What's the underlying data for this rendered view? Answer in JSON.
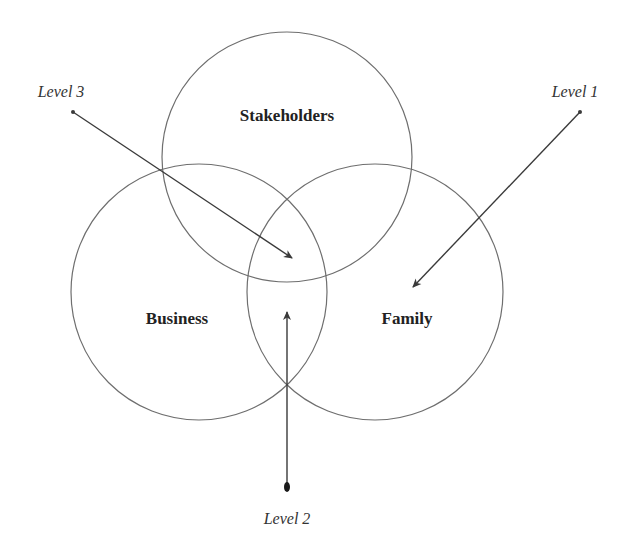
{
  "diagram": {
    "type": "venn",
    "sets": [
      {
        "id": "stakeholders",
        "label": "Stakeholders",
        "cx": 287,
        "cy": 157,
        "r": 125,
        "label_x": 287,
        "label_y": 121
      },
      {
        "id": "business",
        "label": "Business",
        "cx": 199,
        "cy": 292,
        "r": 128,
        "label_x": 177,
        "label_y": 324
      },
      {
        "id": "family",
        "label": "Family",
        "cx": 375,
        "cy": 292,
        "r": 128,
        "label_x": 407,
        "label_y": 324
      }
    ],
    "pointers": [
      {
        "id": "level-3",
        "label": "Level 3",
        "label_x": 61,
        "label_y": 97,
        "from": [
          73,
          112
        ],
        "to": [
          292,
          258
        ]
      },
      {
        "id": "level-1",
        "label": "Level 1",
        "label_x": 575,
        "label_y": 97,
        "from": [
          580,
          112
        ],
        "to": [
          413,
          287
        ]
      },
      {
        "id": "level-2",
        "label": "Level 2",
        "label_x": 287,
        "label_y": 524,
        "from": [
          287,
          487
        ],
        "to": [
          287,
          312
        ]
      }
    ],
    "colors": {
      "background": "#ffffff",
      "circle_stroke": "#6e6e6e",
      "arrow": "#3a3a3a",
      "text": "#222222"
    }
  }
}
